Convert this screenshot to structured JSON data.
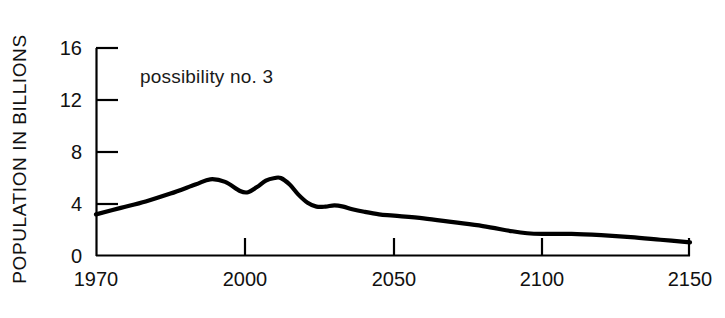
{
  "chart_data": {
    "type": "line",
    "title": "",
    "annotation": "possibility no. 3",
    "xlabel": "",
    "ylabel": "POPULATION IN BILLIONS",
    "ylim": [
      0,
      16
    ],
    "yticks": [
      0,
      4,
      8,
      12,
      16
    ],
    "ytick_labels": [
      "0",
      "4",
      "8",
      "12",
      "16"
    ],
    "xlim": [
      1970,
      2150
    ],
    "xticks": [
      1970,
      2000,
      2050,
      2100,
      2150
    ],
    "xtick_labels": [
      "1970",
      "2000",
      "2050",
      "2100",
      "2150"
    ],
    "grid": false,
    "legend": false,
    "line_color": "#000000",
    "series": [
      {
        "name": "possibility no. 3",
        "x": [
          1970,
          1975,
          1980,
          1985,
          1990,
          1993,
          1996,
          1999,
          2001,
          2004,
          2007,
          2010,
          2012,
          2015,
          2018,
          2021,
          2024,
          2027,
          2030,
          2033,
          2036,
          2040,
          2045,
          2050,
          2060,
          2070,
          2080,
          2090,
          2095,
          2100,
          2110,
          2120,
          2130,
          2140,
          2150
        ],
        "y": [
          3.2,
          3.7,
          4.2,
          4.8,
          5.5,
          5.9,
          5.7,
          5.0,
          4.9,
          5.3,
          5.8,
          6.0,
          6.0,
          5.5,
          4.7,
          4.1,
          3.8,
          3.8,
          3.9,
          3.8,
          3.6,
          3.4,
          3.2,
          3.1,
          2.9,
          2.6,
          2.3,
          1.9,
          1.75,
          1.7,
          1.7,
          1.6,
          1.45,
          1.25,
          1.05
        ]
      }
    ]
  },
  "axis": {
    "ylabel": "POPULATION IN BILLIONS"
  },
  "annotation": {
    "text": "possibility no. 3"
  },
  "yticks": {
    "t0": "0",
    "t1": "4",
    "t2": "8",
    "t3": "12",
    "t4": "16"
  },
  "xticks": {
    "t0": "1970",
    "t1": "2000",
    "t2": "2050",
    "t3": "2100",
    "t4": "2150"
  }
}
